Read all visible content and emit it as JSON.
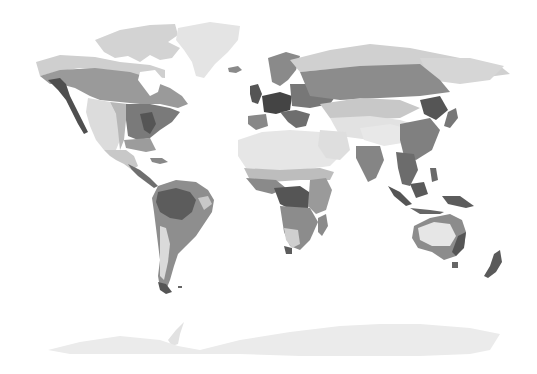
{
  "map": {
    "type": "world-biome-map",
    "projection": "equirectangular-like",
    "style": "grayscale",
    "background": "#ffffff",
    "palette": {
      "ice": "#e9e9e9",
      "tundra": "#d6d6d6",
      "desert": "#e6e6e6",
      "steppe": "#cfcfcf",
      "boreal": "#9e9e9e",
      "temperate": "#8a8a8a",
      "savanna": "#8f8f8f",
      "tropical": "#6a6a6a",
      "dark_forest": "#555555",
      "mountain": "#c4c4c4"
    },
    "regions": [
      "North America",
      "Greenland",
      "South America",
      "Europe",
      "Africa",
      "Asia",
      "Southeast Asia",
      "Australia",
      "New Zealand",
      "Antarctica"
    ]
  }
}
